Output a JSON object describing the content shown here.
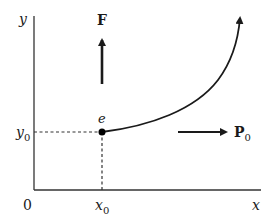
{
  "diagram": {
    "axes": {
      "x_label": "x",
      "y_label": "y",
      "origin_label": "0"
    },
    "point": {
      "label": "e",
      "x_label": "x",
      "x_subscript": "0",
      "y_label": "y",
      "y_subscript": "0"
    },
    "vectors": {
      "force": {
        "label": "F",
        "direction": "up"
      },
      "momentum": {
        "label": "P",
        "subscript": "0",
        "direction": "right"
      }
    },
    "curve": {
      "description": "trajectory curving upward from point e",
      "has_arrowhead": true
    },
    "colors": {
      "stroke": "#1a1a1a",
      "axis": "#333333",
      "background": "#ffffff"
    }
  }
}
